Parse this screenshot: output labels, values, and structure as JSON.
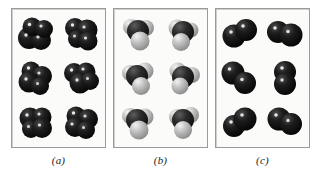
{
  "figure": {
    "type": "molecular-model-figure",
    "background_color": "#ffffff",
    "panel_border_color": "#9a9a98",
    "panel_background_color": "#fbfbf9"
  },
  "panels": [
    {
      "id": "a",
      "caption": "(a)",
      "model_type": "space-filling",
      "molecule_count": 6,
      "grid": {
        "rows": 3,
        "columns": 2
      },
      "atoms_per_molecule": 4,
      "atom_colors": [
        "#161616",
        "#161616",
        "#161616",
        "#161616"
      ],
      "description": "dark four-sphere clusters"
    },
    {
      "id": "b",
      "caption": "(b)",
      "model_type": "space-filling",
      "molecule_count": 6,
      "grid": {
        "rows": 3,
        "columns": 2
      },
      "atoms_per_molecule": 4,
      "atom_colors": [
        "#2a2a2a",
        "#b9b9b9",
        "#a9a9a9",
        "#c3c3c3"
      ],
      "description": "mixed dark and light grey sphere clusters"
    },
    {
      "id": "c",
      "caption": "(c)",
      "model_type": "space-filling",
      "molecule_count": 6,
      "grid": {
        "rows": 3,
        "columns": 2
      },
      "atoms_per_molecule": 2,
      "atom_colors": [
        "#161616",
        "#161616"
      ],
      "description": "dark diatomic sphere pairs"
    }
  ]
}
